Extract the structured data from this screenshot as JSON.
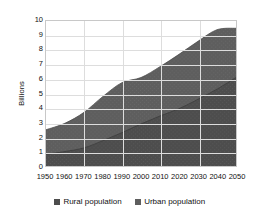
{
  "chart_data": {
    "type": "area",
    "stacked": true,
    "title": "",
    "xlabel": "",
    "ylabel": "Billions",
    "x": [
      1950,
      1960,
      1970,
      1980,
      1990,
      2000,
      2010,
      2020,
      2030,
      2040,
      2050
    ],
    "categories": [
      "1950",
      "1960",
      "1970",
      "1980",
      "1990",
      "2000",
      "2010",
      "2020",
      "2030",
      "2040",
      "2050"
    ],
    "xlim": [
      1950,
      2050
    ],
    "ylim": [
      0,
      10
    ],
    "yticks": [
      0,
      1,
      2,
      3,
      4,
      5,
      6,
      7,
      8,
      9,
      10
    ],
    "ytick_labels": [
      "0",
      "1",
      "2",
      "3",
      "4",
      "5",
      "6",
      "7",
      "8",
      "9",
      "10"
    ],
    "grid": true,
    "legend_position": "bottom",
    "series": [
      {
        "name": "Rural population",
        "color": "#4d4d4d",
        "values": [
          0.8,
          1.0,
          1.25,
          1.75,
          2.3,
          2.9,
          3.45,
          3.95,
          4.6,
          5.3,
          6.1
        ]
      },
      {
        "name": "Urban population",
        "color": "#5e5e5e",
        "values": [
          1.7,
          1.95,
          2.45,
          3.05,
          3.45,
          3.2,
          3.4,
          3.75,
          4.0,
          4.1,
          3.4
        ]
      }
    ],
    "totals": [
      2.5,
      2.95,
      3.7,
      4.8,
      5.75,
      6.1,
      6.85,
      7.7,
      8.6,
      9.4,
      9.5
    ]
  },
  "axis": {
    "y_title": "Billions"
  },
  "legend": {
    "items": [
      {
        "label": "Rural population",
        "swatch_color": "#4d4d4d",
        "icon": "square-swatch"
      },
      {
        "label": "Urban population",
        "swatch_color": "#5e5e5e",
        "icon": "square-swatch"
      }
    ]
  },
  "colors": {
    "rural": "#4d4d4d",
    "urban": "#5e5e5e",
    "grid": "#dddddd",
    "frame": "#c8c8c8",
    "text": "#111111",
    "background": "#ffffff"
  }
}
